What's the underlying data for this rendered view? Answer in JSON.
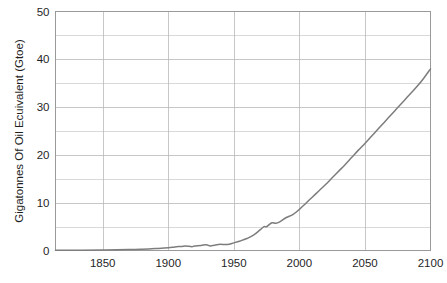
{
  "chart_data": {
    "type": "line",
    "title": "",
    "subtitle": "",
    "xlabel": "",
    "ylabel": "Gigatonnes Of Oil Ecuivalent (Gtoe)",
    "xlim": [
      1814,
      2100
    ],
    "ylim": [
      0,
      50
    ],
    "grid": true,
    "legend": "none",
    "x_ticks": [
      "1850",
      "1900",
      "1950",
      "2000",
      "2050",
      "2100"
    ],
    "x_tick_values": [
      1850,
      1900,
      1950,
      2000,
      2050,
      2100
    ],
    "y_ticks": [
      "0",
      "10",
      "20",
      "30",
      "40",
      "50"
    ],
    "y_tick_values": [
      0,
      10,
      20,
      30,
      40,
      50
    ],
    "y_minor_tick_values": [
      5,
      15,
      25,
      35,
      45
    ],
    "series": [
      {
        "name": "World Primary Energy Demand",
        "color": "#7d7d7d",
        "x": [
          1814,
          1830,
          1850,
          1870,
          1880,
          1890,
          1900,
          1905,
          1910,
          1913,
          1918,
          1920,
          1925,
          1929,
          1932,
          1935,
          1938,
          1940,
          1945,
          1950,
          1955,
          1960,
          1965,
          1970,
          1973,
          1975,
          1979,
          1982,
          1985,
          1990,
          1995,
          2000,
          2005,
          2010,
          2015,
          2020,
          2025,
          2030,
          2035,
          2040,
          2045,
          2050,
          2055,
          2060,
          2065,
          2070,
          2075,
          2080,
          2085,
          2090,
          2095,
          2100
        ],
        "values": [
          0.05,
          0.07,
          0.1,
          0.2,
          0.28,
          0.4,
          0.55,
          0.75,
          0.85,
          0.95,
          0.8,
          0.95,
          1.05,
          1.2,
          0.95,
          1.1,
          1.25,
          1.3,
          1.25,
          1.6,
          2.0,
          2.5,
          3.2,
          4.3,
          5.0,
          5.0,
          5.8,
          5.7,
          6.0,
          6.9,
          7.5,
          8.6,
          9.9,
          11.2,
          12.5,
          13.8,
          15.2,
          16.6,
          18.0,
          19.5,
          21.0,
          22.4,
          23.9,
          25.4,
          26.9,
          28.4,
          29.9,
          31.4,
          32.9,
          34.4,
          36.1,
          38.0
        ]
      }
    ]
  },
  "figure": {
    "background_color": "#ffffff",
    "grid_color": "#b9b9b9",
    "frame_color": "#9a9a9a",
    "text_color": "#1f1f1f"
  }
}
